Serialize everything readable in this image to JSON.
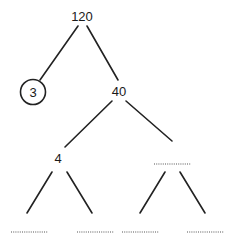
{
  "diagram": {
    "type": "factor-tree",
    "nodes": {
      "root": {
        "label": "120"
      },
      "left_prime": {
        "label": "3",
        "circled": true
      },
      "right_composite": {
        "label": "40"
      },
      "level2_left": {
        "label": "4"
      },
      "level2_right": {
        "label": "",
        "blank": true
      },
      "leaf1": {
        "label": "",
        "blank": true
      },
      "leaf2": {
        "label": "",
        "blank": true
      },
      "leaf3": {
        "label": "",
        "blank": true
      },
      "leaf4": {
        "label": "",
        "blank": true
      }
    },
    "edges": [
      [
        "root",
        "left_prime"
      ],
      [
        "root",
        "right_composite"
      ],
      [
        "right_composite",
        "level2_left"
      ],
      [
        "right_composite",
        "level2_right"
      ],
      [
        "level2_left",
        "leaf1"
      ],
      [
        "level2_left",
        "leaf2"
      ],
      [
        "level2_right",
        "leaf3"
      ],
      [
        "level2_right",
        "leaf4"
      ]
    ],
    "colors": {
      "line": "#222222",
      "text": "#1a1a1a",
      "blank": "#555555",
      "background": "#ffffff"
    }
  }
}
